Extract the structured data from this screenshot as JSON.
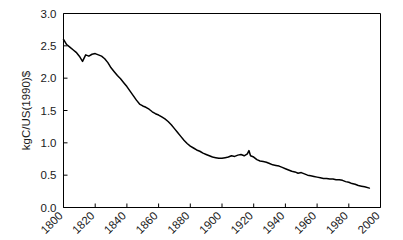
{
  "chart_data": {
    "type": "line",
    "title": "",
    "xlabel": "",
    "ylabel": "kgC/US(1990)$",
    "xlim": [
      1800,
      2000
    ],
    "ylim": [
      0.0,
      3.0
    ],
    "grid": false,
    "legend": "none",
    "xticks": [
      1800,
      1820,
      1840,
      1860,
      1880,
      1900,
      1920,
      1940,
      1960,
      1980,
      2000
    ],
    "xtick_labels": [
      "1800",
      "1820",
      "1840",
      "1860",
      "1880",
      "1900",
      "1920",
      "1940",
      "1960",
      "1980",
      "2000"
    ],
    "yticks": [
      0.0,
      0.5,
      1.0,
      1.5,
      2.0,
      2.5,
      3.0
    ],
    "ytick_labels": [
      "0.0",
      "0.5",
      "1.0",
      "1.5",
      "2.0",
      "2.5",
      "3.0"
    ],
    "line_color": "#000000",
    "series": [
      {
        "name": "carbon-intensity",
        "x": [
          1800,
          1802,
          1804,
          1806,
          1808,
          1810,
          1812,
          1814,
          1816,
          1818,
          1820,
          1822,
          1824,
          1826,
          1828,
          1830,
          1832,
          1834,
          1836,
          1838,
          1840,
          1842,
          1844,
          1846,
          1848,
          1850,
          1852,
          1854,
          1856,
          1858,
          1860,
          1862,
          1864,
          1866,
          1868,
          1870,
          1872,
          1874,
          1876,
          1878,
          1880,
          1882,
          1884,
          1886,
          1888,
          1890,
          1892,
          1894,
          1896,
          1898,
          1900,
          1902,
          1904,
          1906,
          1908,
          1910,
          1912,
          1914,
          1916,
          1917,
          1918,
          1920,
          1922,
          1924,
          1926,
          1928,
          1930,
          1932,
          1934,
          1936,
          1938,
          1940,
          1942,
          1944,
          1946,
          1948,
          1950,
          1952,
          1954,
          1956,
          1958,
          1960,
          1962,
          1964,
          1966,
          1968,
          1970,
          1972,
          1974,
          1976,
          1978,
          1980,
          1982,
          1984,
          1986,
          1988,
          1990,
          1993
        ],
        "values": [
          2.6,
          2.52,
          2.48,
          2.44,
          2.4,
          2.34,
          2.26,
          2.36,
          2.34,
          2.37,
          2.38,
          2.36,
          2.34,
          2.3,
          2.24,
          2.16,
          2.1,
          2.04,
          1.99,
          1.93,
          1.87,
          1.8,
          1.73,
          1.66,
          1.6,
          1.57,
          1.55,
          1.52,
          1.48,
          1.45,
          1.43,
          1.4,
          1.37,
          1.33,
          1.28,
          1.22,
          1.16,
          1.1,
          1.04,
          0.99,
          0.95,
          0.92,
          0.89,
          0.87,
          0.84,
          0.82,
          0.8,
          0.78,
          0.77,
          0.76,
          0.76,
          0.77,
          0.78,
          0.8,
          0.79,
          0.81,
          0.82,
          0.8,
          0.83,
          0.88,
          0.8,
          0.78,
          0.74,
          0.72,
          0.71,
          0.7,
          0.68,
          0.66,
          0.65,
          0.64,
          0.62,
          0.6,
          0.58,
          0.56,
          0.55,
          0.53,
          0.54,
          0.52,
          0.5,
          0.49,
          0.48,
          0.47,
          0.46,
          0.45,
          0.45,
          0.44,
          0.44,
          0.43,
          0.43,
          0.42,
          0.4,
          0.39,
          0.37,
          0.36,
          0.34,
          0.33,
          0.32,
          0.3
        ]
      }
    ]
  }
}
